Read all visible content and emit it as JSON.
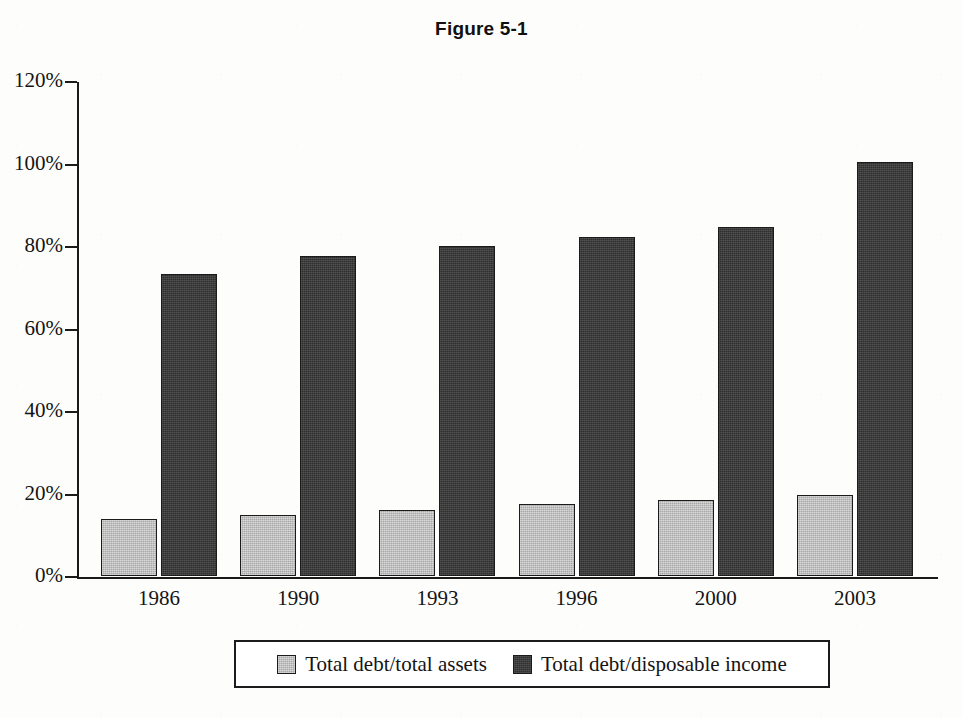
{
  "chart_data": {
    "type": "bar",
    "title": "Figure 5-1",
    "xlabel": "",
    "ylabel": "",
    "ylim": [
      0,
      120
    ],
    "ytick_labels": [
      "0%",
      "20%",
      "40%",
      "60%",
      "80%",
      "100%",
      "120%"
    ],
    "ytick_values": [
      0,
      20,
      40,
      60,
      80,
      100,
      120
    ],
    "grid": false,
    "legend_position": "bottom",
    "categories": [
      "1986",
      "1990",
      "1993",
      "1996",
      "2000",
      "2003"
    ],
    "series": [
      {
        "name": "Total debt/total assets",
        "color": "#a8a8a8",
        "values": [
          13.8,
          14.8,
          16.0,
          17.4,
          18.4,
          19.6
        ]
      },
      {
        "name": "Total debt/disposable income",
        "color": "#2e2e2e",
        "values": [
          73.3,
          77.5,
          80.1,
          82.3,
          84.5,
          100.4
        ]
      }
    ]
  },
  "figure": {
    "title": "Figure 5-1"
  },
  "legend": {
    "items": [
      {
        "label": "Total debt/total assets",
        "swatch": "light"
      },
      {
        "label": "Total debt/disposable income",
        "swatch": "dark"
      }
    ]
  },
  "colors": {
    "light_bar": "#a8a8a8",
    "dark_bar": "#2e2e2e",
    "axis": "#1a1a1a",
    "background": "#fdfdfb"
  }
}
